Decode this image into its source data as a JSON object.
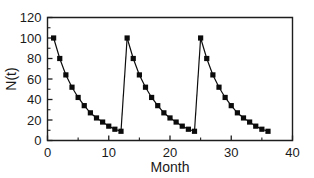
{
  "chart_data": {
    "type": "line",
    "title": "",
    "subtitle": "",
    "xlabel": "Month",
    "ylabel": "N(t)",
    "xlim": [
      0,
      40
    ],
    "ylim": [
      0,
      120
    ],
    "xticks": [
      0,
      10,
      20,
      30,
      40
    ],
    "xtick_labels": [
      "0",
      "10",
      "20",
      "30",
      "40"
    ],
    "xminor_ticks": [
      5,
      15,
      25,
      35
    ],
    "yticks": [
      0,
      20,
      40,
      60,
      80,
      100,
      120
    ],
    "ytick_labels": [
      "0",
      "20",
      "40",
      "60",
      "80",
      "100",
      "120"
    ],
    "yminor_ticks": [
      10,
      30,
      50,
      70,
      90,
      110
    ],
    "grid": false,
    "legend": null,
    "legend_position": "none",
    "marker": "square",
    "marker_color": "#0b0b0b",
    "line_color": "#0d0d0d",
    "annotations": [],
    "series": [
      {
        "name": "N(t)",
        "x": [
          1,
          2,
          3,
          4,
          5,
          6,
          7,
          8,
          9,
          10,
          11,
          12,
          13,
          14,
          15,
          16,
          17,
          18,
          19,
          20,
          21,
          22,
          23,
          24,
          25,
          26,
          27,
          28,
          29,
          30,
          31,
          32,
          33,
          34,
          35,
          36
        ],
        "y": [
          100,
          80,
          64,
          52,
          42,
          34,
          27,
          22,
          18,
          14,
          11,
          9,
          100,
          80,
          64,
          52,
          42,
          34,
          27,
          22,
          18,
          14,
          11,
          9,
          100,
          80,
          64,
          52,
          42,
          34,
          27,
          22,
          18,
          14,
          11,
          9
        ]
      }
    ],
    "segments": [
      {
        "name": "cycle-1",
        "x": [
          1,
          2,
          3,
          4,
          5,
          6,
          7,
          8,
          9,
          10,
          11,
          12
        ],
        "y": [
          100,
          80,
          64,
          52,
          42,
          34,
          27,
          22,
          18,
          14,
          11,
          9
        ]
      },
      {
        "name": "cycle-2",
        "x": [
          13,
          14,
          15,
          16,
          17,
          18,
          19,
          20,
          21,
          22,
          23,
          24
        ],
        "y": [
          100,
          80,
          64,
          52,
          42,
          34,
          27,
          22,
          18,
          14,
          11,
          9
        ]
      },
      {
        "name": "cycle-3",
        "x": [
          25,
          26,
          27,
          28,
          29,
          30,
          31,
          32,
          33,
          34,
          35,
          36
        ],
        "y": [
          100,
          80,
          64,
          52,
          42,
          34,
          27,
          22,
          18,
          14,
          11,
          9
        ]
      }
    ],
    "connectors": [
      {
        "name": "reset-1",
        "x": [
          12,
          13
        ],
        "y": [
          9,
          100
        ]
      },
      {
        "name": "reset-2",
        "x": [
          24,
          25
        ],
        "y": [
          9,
          100
        ]
      }
    ]
  }
}
